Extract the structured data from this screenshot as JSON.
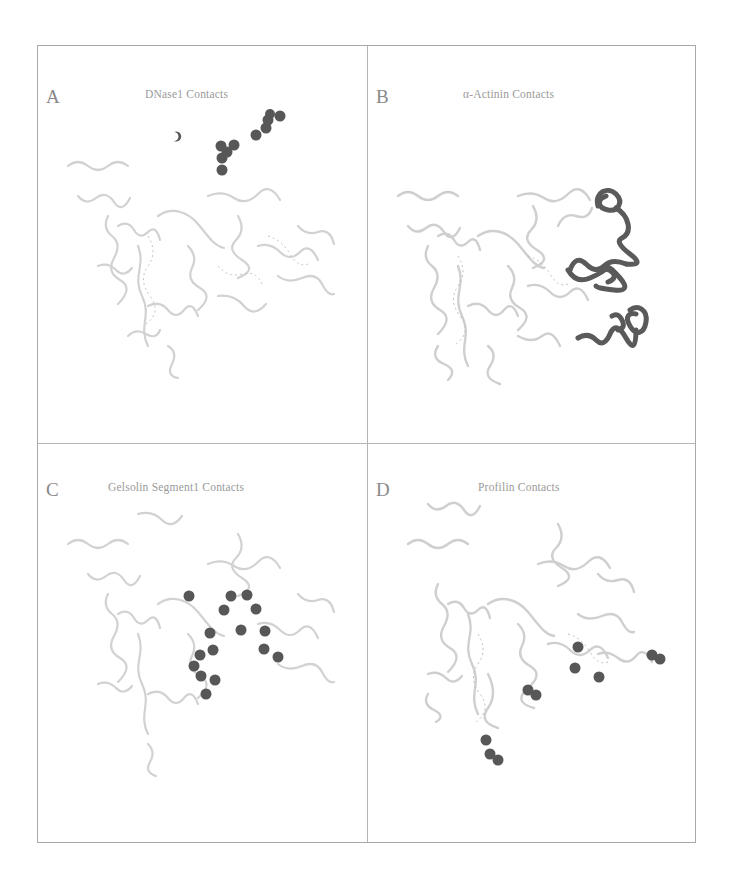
{
  "figure": {
    "colors": {
      "background": "#ffffff",
      "frame": "#a8a8a8",
      "ribbon": "#d4d4d4",
      "contact": "#555555",
      "label_text": "#8a8a8a"
    },
    "panels": [
      {
        "letter": "A",
        "title": "DNase1 Contacts",
        "highlight_style": "contact-residue-spheres",
        "highlight_region": "top"
      },
      {
        "letter": "B",
        "title": "α-Actinin Contacts",
        "highlight_style": "contact-ribbon-segment",
        "highlight_region": "right"
      },
      {
        "letter": "C",
        "title": "Gelsolin Segment1 Contacts",
        "highlight_style": "contact-residue-spheres",
        "highlight_region": "center-bottom"
      },
      {
        "letter": "D",
        "title": "Profilin Contacts",
        "highlight_style": "contact-residue-spheres",
        "highlight_region": "bottom"
      }
    ]
  }
}
